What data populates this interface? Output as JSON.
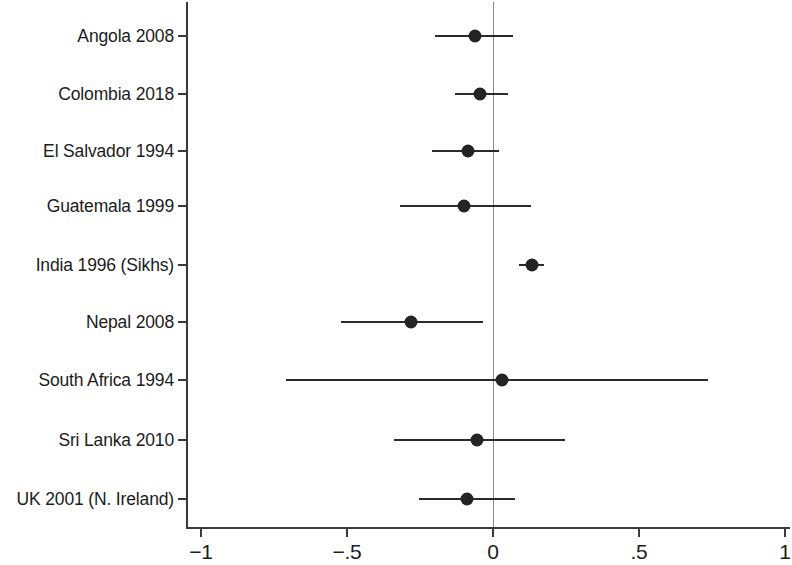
{
  "chart_data": {
    "type": "scatter",
    "subtype": "forest-plot",
    "title": "",
    "xlabel": "",
    "ylabel": "",
    "xlim": [
      -1,
      1
    ],
    "xticks": [
      -1,
      -0.5,
      0,
      0.5,
      1
    ],
    "xtick_labels": [
      "−1",
      "−.5",
      "0",
      ".5",
      "1"
    ],
    "grid": false,
    "legend": null,
    "reference_line": 0,
    "categories": [
      "Angola 2008",
      "Colombia 2018",
      "El Salvador 1994",
      "Guatemala 1999",
      "India 1996 (Sikhs)",
      "Nepal 2008",
      "South Africa 1994",
      "Sri Lanka 2010",
      "UK 2001 (N. Ireland)"
    ],
    "points": [
      {
        "label": "Angola 2008",
        "estimate": -0.06,
        "ci_low": -0.2,
        "ci_high": 0.07
      },
      {
        "label": "Colombia 2018",
        "estimate": -0.045,
        "ci_low": -0.13,
        "ci_high": 0.05
      },
      {
        "label": "El Salvador 1994",
        "estimate": -0.085,
        "ci_low": -0.21,
        "ci_high": 0.02
      },
      {
        "label": "Guatemala 1999",
        "estimate": -0.1,
        "ci_low": -0.32,
        "ci_high": 0.13
      },
      {
        "label": "India 1996 (Sikhs)",
        "estimate": 0.135,
        "ci_low": 0.09,
        "ci_high": 0.175
      },
      {
        "label": "Nepal 2008",
        "estimate": -0.28,
        "ci_low": -0.52,
        "ci_high": -0.035
      },
      {
        "label": "South Africa 1994",
        "estimate": 0.03,
        "ci_low": -0.71,
        "ci_high": 0.735
      },
      {
        "label": "Sri Lanka 2010",
        "estimate": -0.055,
        "ci_low": -0.34,
        "ci_high": 0.245
      },
      {
        "label": "UK 2001 (N. Ireland)",
        "estimate": -0.09,
        "ci_low": -0.255,
        "ci_high": 0.075
      }
    ],
    "colors": {
      "marker": "#242424",
      "ci_line": "#2b2b2b",
      "axis": "#3a3a3a",
      "reference_line": "#8d8d8d",
      "background": "#ffffff",
      "text": "#1c1c1c"
    }
  },
  "layout": {
    "plot_left_px": 186,
    "plot_right_px": 790,
    "plot_top_px": 2,
    "plot_bottom_px": 527,
    "x_zero_px": 493,
    "px_per_unit": 292,
    "row_y_px": [
      36,
      94,
      151,
      206,
      265,
      322,
      380,
      440,
      499
    ]
  }
}
